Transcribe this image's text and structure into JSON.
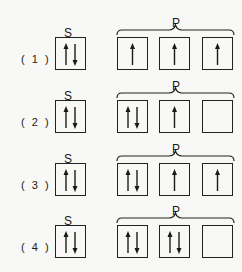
{
  "diagram": {
    "s_label": "S",
    "p_label": "P",
    "options": [
      {
        "label": "( 1 )",
        "s": "updown",
        "p": [
          "up",
          "up",
          "up"
        ]
      },
      {
        "label": "( 2 )",
        "s": "updown",
        "p": [
          "updown",
          "up",
          "empty"
        ]
      },
      {
        "label": "( 3 )",
        "s": "updown",
        "p": [
          "updown",
          "up",
          "up"
        ]
      },
      {
        "label": "( 4 )",
        "s": "updown",
        "p": [
          "updown",
          "updown",
          "empty"
        ]
      }
    ]
  },
  "colors": {
    "ink": "#1a1a1a",
    "background": "#f8f8f6"
  }
}
